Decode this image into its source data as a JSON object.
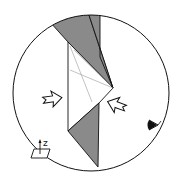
{
  "diagram": {
    "type": "folding-instruction",
    "colors": {
      "background": "#ffffff",
      "outline": "#111111",
      "shade": "#8a8a8a",
      "crease": "#999999"
    },
    "labels": {
      "axis": "z"
    },
    "icons": {
      "arrow_left": "push-arrow-right",
      "arrow_right": "push-arrow-left",
      "eye": "eye-viewpoint",
      "axis": "z-axis-plane"
    }
  }
}
